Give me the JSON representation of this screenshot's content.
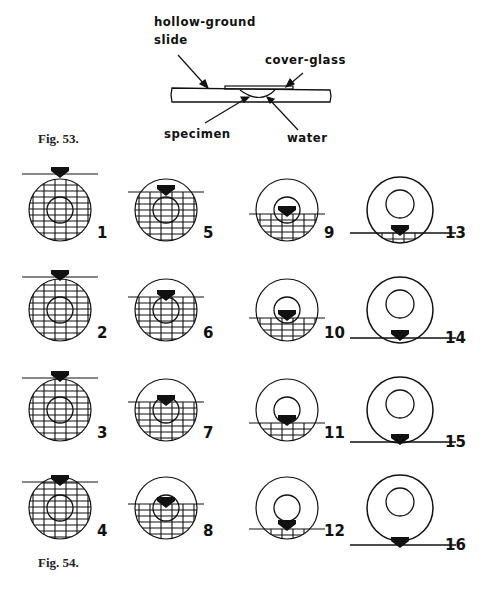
{
  "fig53": {
    "caption": "Fig. 53.",
    "labels": {
      "hollow_ground": "hollow-ground",
      "slide": "slide",
      "cover_glass": "cover-glass",
      "specimen": "specimen",
      "water": "water"
    }
  },
  "fig54": {
    "caption": "Fig. 54.",
    "panels": [
      {
        "n": "1"
      },
      {
        "n": "2"
      },
      {
        "n": "3"
      },
      {
        "n": "4"
      },
      {
        "n": "5"
      },
      {
        "n": "6"
      },
      {
        "n": "7"
      },
      {
        "n": "8"
      },
      {
        "n": "9"
      },
      {
        "n": "10"
      },
      {
        "n": "11"
      },
      {
        "n": "12"
      },
      {
        "n": "13"
      },
      {
        "n": "14"
      },
      {
        "n": "15"
      },
      {
        "n": "16"
      }
    ]
  },
  "colors": {
    "ink": "#111111",
    "paper": "#ffffff"
  }
}
